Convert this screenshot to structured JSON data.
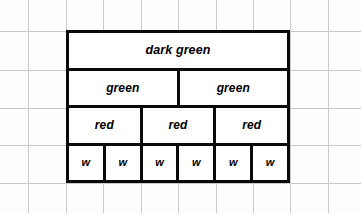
{
  "diagram": {
    "background": {
      "paper_color": "#fdfdfd",
      "grid_color": "#c9c9c9",
      "grid_spacing_px": 37.4,
      "grid_vertical_x": [
        28,
        66,
        103,
        141,
        178,
        216,
        253,
        290,
        328
      ],
      "grid_horizontal_y": [
        31,
        70,
        108,
        145,
        183
      ]
    },
    "outline": {
      "stroke_color": "#0a0a0a",
      "stroke_width_px": 3,
      "left": 66,
      "top": 30,
      "width": 224,
      "height": 153
    },
    "rows": [
      {
        "name": "dark-green-row",
        "divisions": 1,
        "cells": [
          {
            "label": "dark green"
          }
        ]
      },
      {
        "name": "green-row",
        "divisions": 2,
        "cells": [
          {
            "label": "green"
          },
          {
            "label": "green"
          }
        ]
      },
      {
        "name": "red-row",
        "divisions": 3,
        "cells": [
          {
            "label": "red"
          },
          {
            "label": "red"
          },
          {
            "label": "red"
          }
        ]
      },
      {
        "name": "w-row",
        "divisions": 6,
        "cells": [
          {
            "label": "w"
          },
          {
            "label": "w"
          },
          {
            "label": "w"
          },
          {
            "label": "w"
          },
          {
            "label": "w"
          },
          {
            "label": "w"
          }
        ]
      }
    ]
  }
}
